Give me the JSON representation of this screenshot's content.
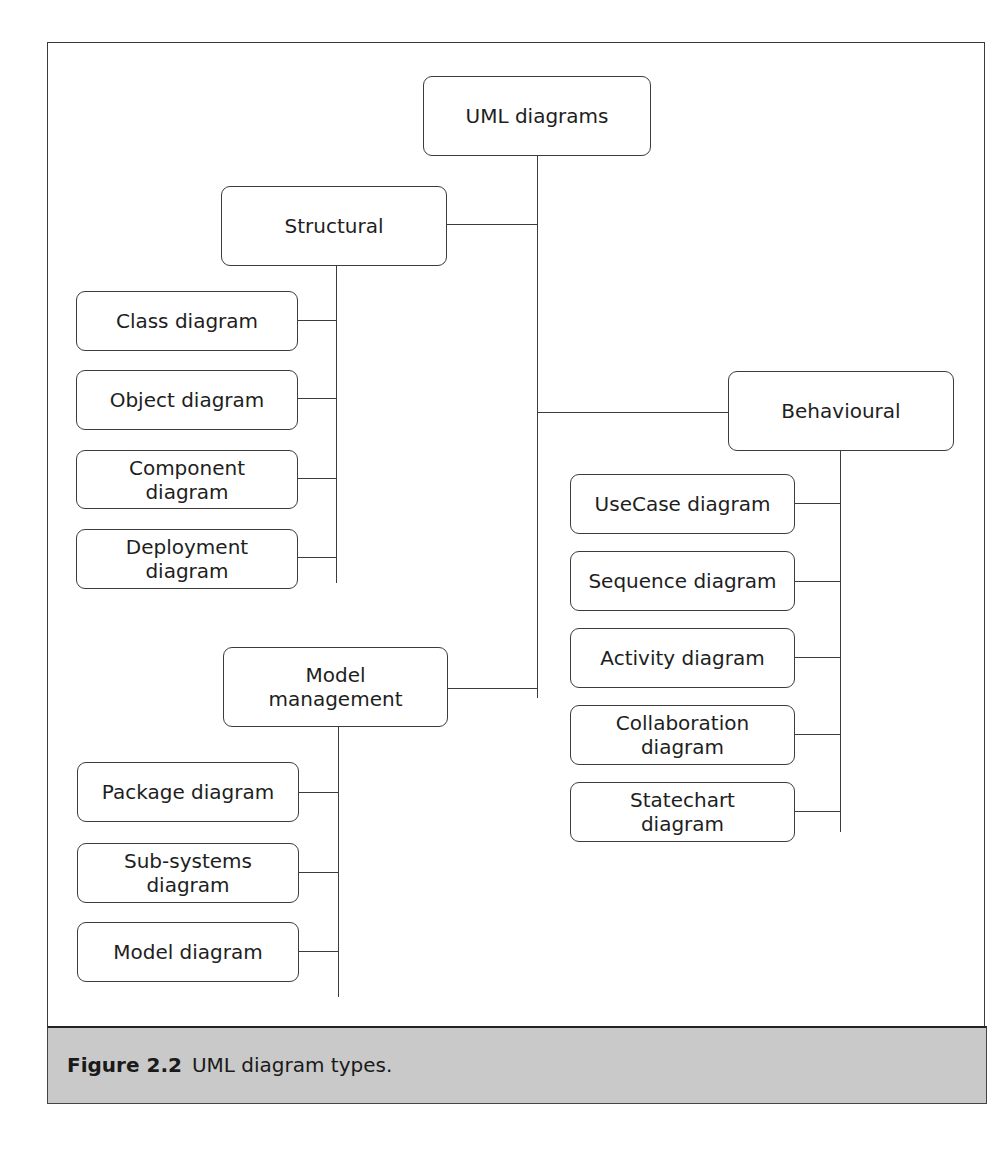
{
  "diagram": {
    "root": {
      "label": "UML diagrams"
    },
    "categories": [
      {
        "id": "structural",
        "label": "Structural",
        "children": [
          {
            "label": "Class diagram"
          },
          {
            "label": "Object diagram"
          },
          {
            "label": "Component diagram"
          },
          {
            "label": "Deployment diagram"
          }
        ]
      },
      {
        "id": "behavioural",
        "label": "Behavioural",
        "children": [
          {
            "label": "UseCase diagram"
          },
          {
            "label": "Sequence diagram"
          },
          {
            "label": "Activity diagram"
          },
          {
            "label": "Collaboration diagram"
          },
          {
            "label": "Statechart diagram"
          }
        ]
      },
      {
        "id": "model-management",
        "label": "Model management",
        "children": [
          {
            "label": "Package diagram"
          },
          {
            "label": "Sub-systems diagram"
          },
          {
            "label": "Model diagram"
          }
        ]
      }
    ]
  },
  "caption": {
    "label": "Figure 2.2",
    "text": "UML diagram types."
  },
  "colors": {
    "line": "#3c3c3c",
    "caption_bg": "#c9c9c9",
    "text": "#1e1e1e"
  }
}
